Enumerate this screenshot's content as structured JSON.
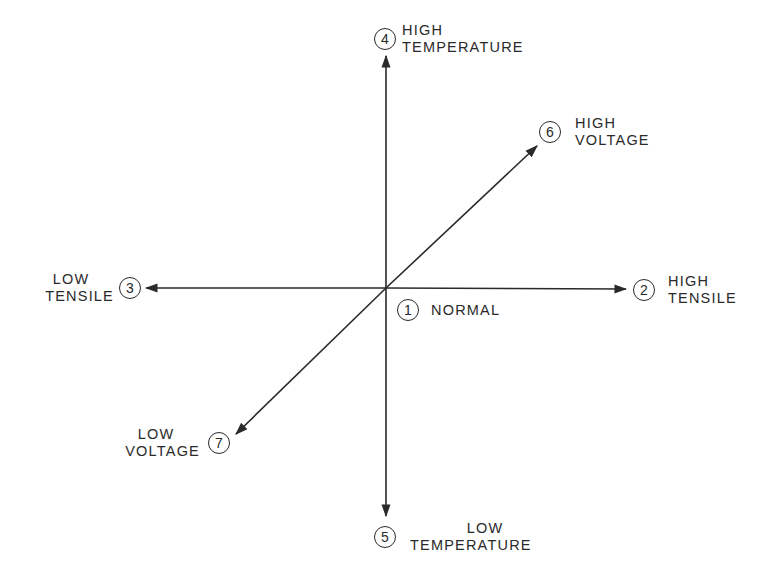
{
  "diagram": {
    "type": "axes-diagram",
    "center": {
      "number": "1",
      "label": "NORMAL"
    },
    "nodes": [
      {
        "id": 1,
        "number": "1",
        "line1": "NORMAL",
        "line2": ""
      },
      {
        "id": 2,
        "number": "2",
        "line1": "HIGH",
        "line2": "TENSILE"
      },
      {
        "id": 3,
        "number": "3",
        "line1": "LOW",
        "line2": "TENSILE"
      },
      {
        "id": 4,
        "number": "4",
        "line1": "HIGH",
        "line2": "TEMPERATURE"
      },
      {
        "id": 5,
        "number": "5",
        "line1": "LOW",
        "line2": "TEMPERATURE"
      },
      {
        "id": 6,
        "number": "6",
        "line1": "HIGH",
        "line2": "VOLTAGE"
      },
      {
        "id": 7,
        "number": "7",
        "line1": "LOW",
        "line2": "VOLTAGE"
      }
    ],
    "axes": [
      {
        "name": "tensile",
        "from": "LOW TENSILE",
        "to": "HIGH TENSILE"
      },
      {
        "name": "temperature",
        "from": "LOW TEMPERATURE",
        "to": "HIGH TEMPERATURE"
      },
      {
        "name": "voltage",
        "from": "LOW VOLTAGE",
        "to": "HIGH VOLTAGE"
      }
    ],
    "colors": {
      "line": "#2a2a2a",
      "background": "#ffffff"
    }
  }
}
